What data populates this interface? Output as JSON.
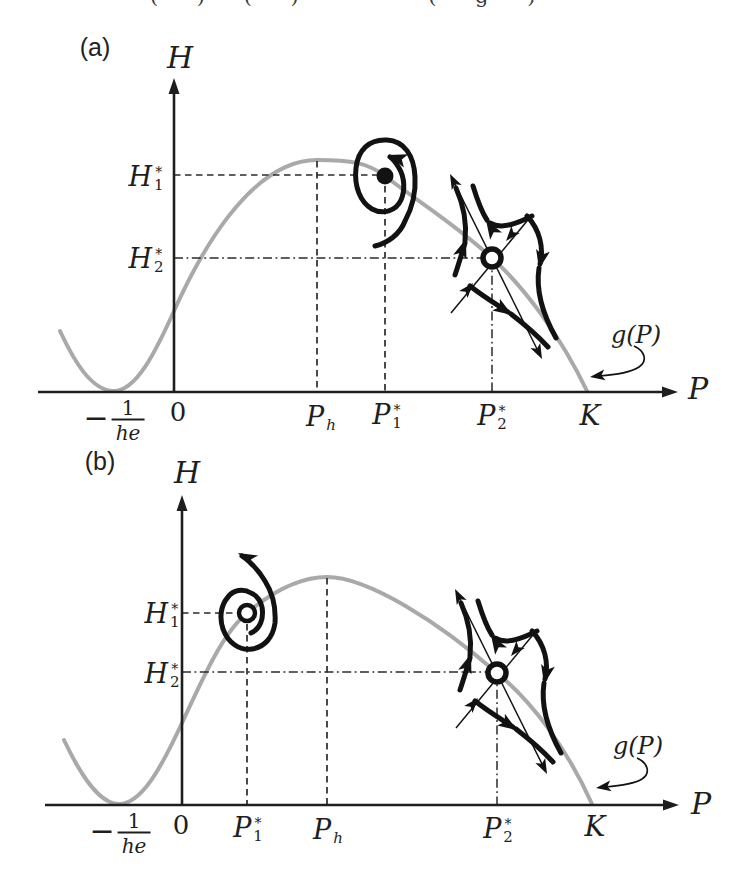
{
  "top_fragment": "( ) ( ) · · ( g )",
  "colors": {
    "ink": "#1e1e1e",
    "curve_gray": "#a9a9a9",
    "trajectory_black": "#121212",
    "background": "#ffffff"
  },
  "panels": {
    "a": {
      "tag": "(a)",
      "y_axis": "H",
      "x_axis": "P",
      "curve_label": "g(P)",
      "y_ticks": {
        "h1": {
          "base": "H",
          "sub": "1",
          "sup": "*",
          "line_style": "dashed"
        },
        "h2": {
          "base": "H",
          "sub": "2",
          "sup": "*",
          "line_style": "dash-dot"
        }
      },
      "x_ticks": {
        "neg_inv_he": {
          "sign": "−",
          "num": "1",
          "den": "he"
        },
        "zero": "0",
        "ph": {
          "base": "P",
          "sub": "h",
          "line_style": "dashed"
        },
        "p1": {
          "base": "P",
          "sub": "1",
          "sup": "*",
          "line_style": "dashed"
        },
        "p2": {
          "base": "P",
          "sub": "2",
          "sup": "*",
          "line_style": "dash-dot"
        },
        "k": "K"
      },
      "equilibria": [
        {
          "at": "(P1*, H1*)",
          "type": "stable focus",
          "marker": "filled dot",
          "flow": "inward spiral, arrow at top pointing left"
        },
        {
          "at": "(P2*, H2*)",
          "type": "saddle",
          "marker": "open circle",
          "flow": "outward arrows along unstable manifold, inward arrows along stable manifold, four hyperbolic trajectories"
        }
      ]
    },
    "b": {
      "tag": "(b)",
      "y_axis": "H",
      "x_axis": "P",
      "curve_label": "g(P)",
      "y_ticks": {
        "h1": {
          "base": "H",
          "sub": "1",
          "sup": "*",
          "line_style": "dashed"
        },
        "h2": {
          "base": "H",
          "sub": "2",
          "sup": "*",
          "line_style": "dash-dot"
        }
      },
      "x_ticks": {
        "neg_inv_he": {
          "sign": "−",
          "num": "1",
          "den": "he"
        },
        "zero": "0",
        "p1": {
          "base": "P",
          "sub": "1",
          "sup": "*",
          "line_style": "dashed"
        },
        "ph": {
          "base": "P",
          "sub": "h",
          "line_style": "dashed"
        },
        "p2": {
          "base": "P",
          "sub": "2",
          "sup": "*",
          "line_style": "dash-dot"
        },
        "k": "K"
      },
      "equilibria": [
        {
          "at": "(P1*, H1*)",
          "type": "unstable focus",
          "marker": "open circle",
          "flow": "outward spiral escaping with large arrow to upper left"
        },
        {
          "at": "(P2*, H2*)",
          "type": "saddle",
          "marker": "open circle",
          "flow": "outward arrows along unstable manifold, inward arrows along stable manifold, four hyperbolic trajectories"
        }
      ]
    }
  }
}
